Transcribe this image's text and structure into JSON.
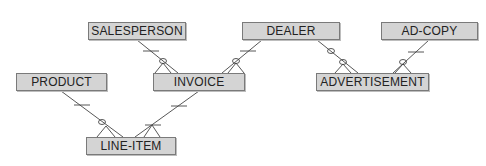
{
  "diagram": {
    "type": "entity-relationship",
    "entities": [
      {
        "id": "salesperson",
        "label": "SALESPERSON",
        "x": 88,
        "y": 22,
        "w": 98
      },
      {
        "id": "dealer",
        "label": "DEALER",
        "x": 242,
        "y": 22,
        "w": 98
      },
      {
        "id": "adcopy",
        "label": "AD-COPY",
        "x": 381,
        "y": 22,
        "w": 97
      },
      {
        "id": "product",
        "label": "PRODUCT",
        "x": 16,
        "y": 73,
        "w": 91
      },
      {
        "id": "invoice",
        "label": "INVOICE",
        "x": 153,
        "y": 73,
        "w": 92
      },
      {
        "id": "advertisement",
        "label": "ADVERTISEMENT",
        "x": 316,
        "y": 73,
        "w": 113
      },
      {
        "id": "lineitem",
        "label": "LINE-ITEM",
        "x": 86,
        "y": 137,
        "w": 90
      }
    ],
    "relationships": [
      {
        "from": "SALESPERSON",
        "to": "INVOICE",
        "from_cardinality": "one",
        "to_cardinality": "zero-or-many"
      },
      {
        "from": "DEALER",
        "to": "INVOICE",
        "from_cardinality": "one",
        "to_cardinality": "zero-or-many"
      },
      {
        "from": "DEALER",
        "to": "ADVERTISEMENT",
        "from_cardinality": "zero-or-one",
        "to_cardinality": "zero-or-many"
      },
      {
        "from": "AD-COPY",
        "to": "ADVERTISEMENT",
        "from_cardinality": "one",
        "to_cardinality": "zero-or-many"
      },
      {
        "from": "PRODUCT",
        "to": "LINE-ITEM",
        "from_cardinality": "one",
        "to_cardinality": "zero-or-many"
      },
      {
        "from": "INVOICE",
        "to": "LINE-ITEM",
        "from_cardinality": "one",
        "to_cardinality": "one-or-many"
      }
    ],
    "colors": {
      "entity_fill": "#d4d4d4",
      "entity_border": "#7a7a7a",
      "line": "#444444"
    }
  }
}
